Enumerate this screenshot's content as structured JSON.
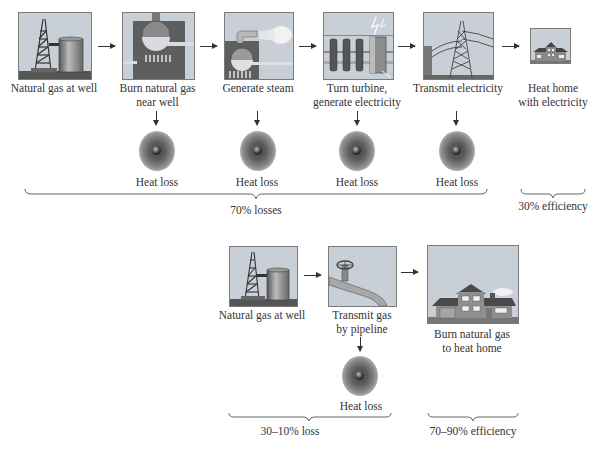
{
  "top_row": {
    "steps": [
      {
        "label": "Natural gas at well",
        "icon": "gas-well-icon"
      },
      {
        "label": "Burn natural gas\nnear well",
        "label_line1": "Burn natural gas",
        "label_line2": "near well",
        "icon": "furnace-icon"
      },
      {
        "label": "Generate steam",
        "icon": "boiler-steam-icon"
      },
      {
        "label": "Turn turbine,\ngenerate electricity",
        "label_line1": "Turn turbine,",
        "label_line2": "generate electricity",
        "icon": "turbine-icon"
      },
      {
        "label": "Transmit electricity",
        "icon": "power-tower-icon"
      },
      {
        "label": "Heat home\nwith electricity",
        "label_line1": "Heat home",
        "label_line2": "with electricity",
        "icon": "house-icon"
      }
    ],
    "heat_losses": [
      "Heat loss",
      "Heat loss",
      "Heat loss",
      "Heat loss"
    ],
    "loss_summary": "70% losses",
    "efficiency_summary": "30% efficiency"
  },
  "bottom_row": {
    "steps": [
      {
        "label": "Natural gas at well",
        "icon": "gas-well-icon"
      },
      {
        "label": "Transmit gas\nby pipeline",
        "label_line1": "Transmit gas",
        "label_line2": "by pipeline",
        "icon": "pipeline-icon"
      },
      {
        "label": "Burn natural gas\nto heat home",
        "label_line1": "Burn natural gas",
        "label_line2": "to heat home",
        "icon": "house-icon"
      }
    ],
    "heat_losses": [
      "Heat loss"
    ],
    "loss_summary": "30–10% loss",
    "efficiency_summary": "70–90% efficiency"
  },
  "colors": {
    "panel_bg": "#c9cfd6",
    "dark_gray": "#5e5e5e",
    "ground": "#4a4a4a",
    "text": "#333333"
  }
}
